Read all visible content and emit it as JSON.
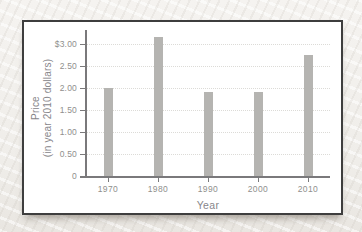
{
  "figure": {
    "background_color": "#f2f0ec",
    "frame_border_color": "#3e3e3e",
    "bar_color": "#b5b4b1",
    "axis_color": "#7a797b",
    "label_color": "#908f8d",
    "gridline_color": "#dcdbd7"
  },
  "chart_data": {
    "type": "bar",
    "title": "",
    "xlabel": "Year",
    "ylabel": "Price (in year 2010 dollars)",
    "ylabel_lines": [
      "Price",
      "(in year 2010 dollars)"
    ],
    "categories": [
      "1970",
      "1980",
      "1990",
      "2000",
      "2010"
    ],
    "values": [
      2.0,
      3.15,
      1.9,
      1.9,
      2.75
    ],
    "ytick_values": [
      0,
      0.5,
      1.0,
      1.5,
      2.0,
      2.5,
      3.0
    ],
    "ytick_labels": [
      "0",
      "0.50",
      "1.00",
      "1.50",
      "2.00",
      "2.50",
      "$3.00"
    ],
    "ylim": [
      0,
      3.3
    ],
    "grid": true,
    "legend_position": null
  }
}
